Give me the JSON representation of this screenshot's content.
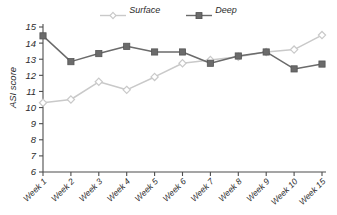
{
  "chart_data": {
    "type": "line",
    "title": "",
    "xlabel": "",
    "ylabel": "ASI score",
    "ylim": [
      6,
      15
    ],
    "yticks": [
      6,
      7,
      8,
      9,
      10,
      11,
      12,
      13,
      14,
      15
    ],
    "grid": false,
    "legend_position": "top-center",
    "categories": [
      "Week 1",
      "Week 2",
      "Week 3",
      "Week 4",
      "Week 5",
      "Week 6",
      "Week 7",
      "Week 8",
      "Week 9",
      "Week 10",
      "Week 15"
    ],
    "series": [
      {
        "name": "Surface",
        "color": "#c9c9c9",
        "marker": "open-diamond",
        "values": [
          10.3,
          10.5,
          11.6,
          11.1,
          11.9,
          12.75,
          12.95,
          13.15,
          13.45,
          13.6,
          14.5
        ]
      },
      {
        "name": "Deep",
        "color": "#6b6b6b",
        "marker": "filled-square",
        "values": [
          14.45,
          12.85,
          13.35,
          13.8,
          13.45,
          13.45,
          12.75,
          13.2,
          13.45,
          12.4,
          12.7
        ]
      }
    ]
  },
  "legend": {
    "entries": [
      {
        "label": "Surface"
      },
      {
        "label": "Deep"
      }
    ]
  },
  "axis": {
    "y_label": "ASI score",
    "y_tick_labels": [
      "15",
      "14",
      "13",
      "12",
      "11",
      "10",
      "9",
      "8",
      "7",
      "6"
    ],
    "x_tick_labels": [
      "Week 1",
      "Week 2",
      "Week 3",
      "Week 4",
      "Week 5",
      "Week 6",
      "Week 7",
      "Week 8",
      "Week 9",
      "Week 10",
      "Week 15"
    ]
  },
  "colors": {
    "surface": "#c9c9c9",
    "deep": "#6b6b6b",
    "axis": "#4d4d4d",
    "text": "#2b2b2b",
    "background": "#ffffff"
  }
}
